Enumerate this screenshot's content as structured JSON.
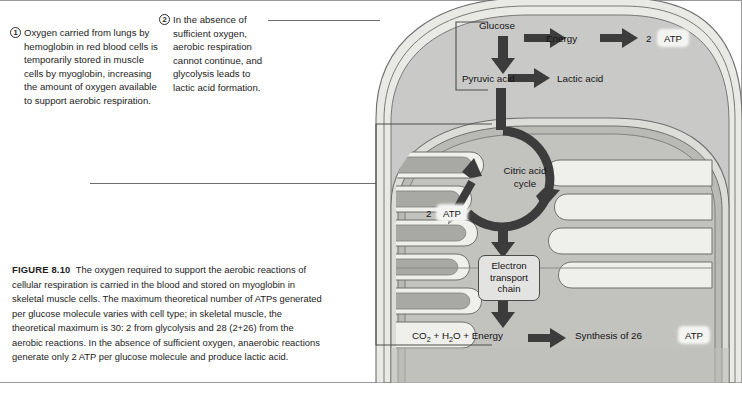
{
  "figure": {
    "label": "FIGURE 8.10",
    "caption": "The oxygen required to support the aerobic reactions of cellular respiration is carried in the blood and stored on myoglobin in skeletal muscle cells. The maximum theoretical number of ATPs generated per glucose molecule varies with cell type; in skeletal muscle, the theoretical maximum is 30: 2 from glycolysis and 28 (2+26) from the aerobic reactions. In the absence of sufficient oxygen, anaerobic reactions generate only 2 ATP per glucose molecule and produce lactic acid."
  },
  "annotations": [
    {
      "number": "1",
      "text": "Oxygen carried from lungs by hemoglobin in red blood cells is temporarily stored in muscle cells by myoglobin, increasing the amount of oxygen available to support aerobic respiration."
    },
    {
      "number": "2",
      "text": "In the absence of sufficient oxygen, aerobic respiration cannot continue, and glycolysis leads to lactic acid formation."
    }
  ],
  "diagram": {
    "glucose": "Glucose",
    "energy": "Energy",
    "atp_glycolysis_count": "2",
    "atp_label": "ATP",
    "pyruvic_acid": "Pyruvic acid",
    "lactic_acid": "Lactic acid",
    "citric_acid_cycle_line1": "Citric acid",
    "citric_acid_cycle_line2": "cycle",
    "atp_cycle_count": "2",
    "atp_cycle_label": "ATP",
    "electron_transport_line1": "Electron",
    "electron_transport_line2": "transport",
    "electron_transport_line3": "chain",
    "products_co2": "CO",
    "products_co2_sub": "2",
    "products_plus1": "+",
    "products_h2o": "H",
    "products_h2o_sub": "2",
    "products_h2o_tail": "O",
    "products_plus2": "+",
    "products_energy": "Energy",
    "synthesis_text": "Synthesis of 26",
    "atp_synthesis_label": "ATP"
  },
  "colors": {
    "cytoplasm": "#c9c9c7",
    "outer_membrane": "#efefec",
    "matrix": "#b4b4b2",
    "cristae_fill": "#a6a6a4",
    "arrow": "#3c3c3c",
    "outline": "#6b6b6b",
    "text": "#1a1a1a"
  }
}
